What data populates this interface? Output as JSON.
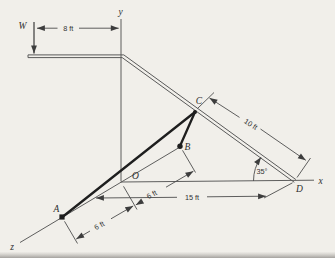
{
  "figure": {
    "load_label": "W",
    "axes": {
      "x": "x",
      "y": "y",
      "z": "z"
    },
    "points": {
      "A": "A",
      "B": "B",
      "C": "C",
      "D": "D",
      "O": "O"
    },
    "dimensions": {
      "arm_length": "8 ft",
      "cd_length": "10 ft",
      "incline_angle": "35°",
      "od_length": "15 ft",
      "ao_length": "6 ft",
      "ob_length": "6 ft"
    },
    "colors": {
      "background": "#f1efea",
      "line": "#4d4d4d",
      "cable": "#1e1e1e",
      "text": "#333333"
    }
  }
}
